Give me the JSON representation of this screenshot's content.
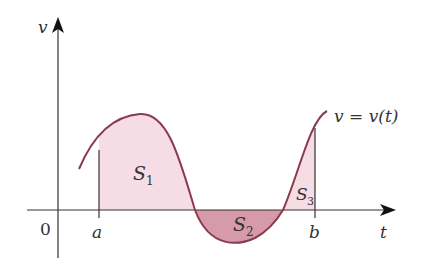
{
  "figure": {
    "axes": {
      "y_label": "v",
      "x_label": "t",
      "origin_label": "0"
    },
    "curve": {
      "label": "v = v(t)",
      "color": "#8a3a4e"
    },
    "bounds": {
      "a_label": "a",
      "b_label": "b"
    },
    "regions": [
      {
        "name": "S",
        "sub": "1",
        "sign": "positive",
        "fill": "#f6dce5"
      },
      {
        "name": "S",
        "sub": "2",
        "sign": "negative",
        "fill": "#d79aab"
      },
      {
        "name": "S",
        "sub": "3",
        "sign": "positive",
        "fill": "#f6dce5"
      }
    ]
  }
}
